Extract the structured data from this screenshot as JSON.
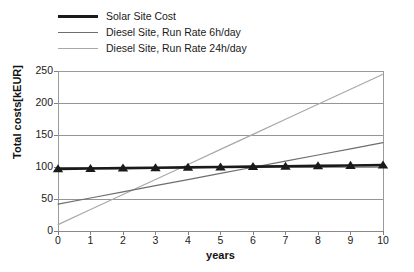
{
  "chart_data": {
    "type": "line",
    "title": "",
    "xlabel": "years",
    "ylabel": "Total costs[kEUR]",
    "xlim": [
      0,
      10
    ],
    "ylim": [
      0,
      250
    ],
    "xticks": [
      "0",
      "1",
      "2",
      "3",
      "4",
      "5",
      "6",
      "7",
      "8",
      "9",
      "10"
    ],
    "yticks": [
      "0",
      "50",
      "100",
      "150",
      "200",
      "250"
    ],
    "grid": "horizontal",
    "legend_position": "above-plot-left",
    "x": [
      0,
      1,
      2,
      3,
      4,
      5,
      6,
      7,
      8,
      9,
      10
    ],
    "series": [
      {
        "name": "Solar Site Cost",
        "color": "#1a1a1a",
        "width": 2.6,
        "marker": "triangle",
        "values": [
          97,
          97.6,
          98.2,
          98.8,
          99.4,
          100,
          100.6,
          101.2,
          101.8,
          102.4,
          103
        ]
      },
      {
        "name": "Diesel Site, Run Rate 6h/day",
        "color": "#6e6e6e",
        "width": 1.2,
        "marker": "none",
        "values": [
          42,
          51.6,
          61.2,
          70.8,
          80.4,
          90,
          99.6,
          109.2,
          118.8,
          128.4,
          138
        ]
      },
      {
        "name": "Diesel Site, Run Rate 24h/day",
        "color": "#a8a8a8",
        "width": 1.2,
        "marker": "none",
        "values": [
          10,
          33.5,
          57,
          80.5,
          104,
          127.5,
          151,
          174.5,
          198,
          221.5,
          245
        ]
      }
    ]
  },
  "legend": {
    "entries": [
      {
        "label": "Solar Site Cost"
      },
      {
        "label": "Diesel Site, Run Rate 6h/day"
      },
      {
        "label": "Diesel Site, Run Rate 24h/day"
      }
    ]
  },
  "colors": {
    "axis": "#808080",
    "grid": "#8a8a8a",
    "plot_border": "#9a9a9a",
    "background": "#ffffff",
    "text": "#1a1a1a"
  }
}
